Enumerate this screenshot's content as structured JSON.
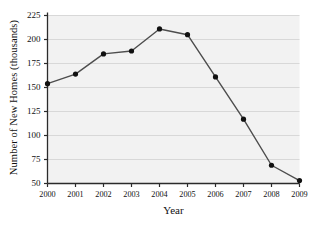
{
  "chart_data": {
    "type": "line",
    "title": "",
    "xlabel": "Year",
    "ylabel": "Number of New Homes (thousands)",
    "categories": [
      "2000",
      "2001",
      "2002",
      "2003",
      "2004",
      "2005",
      "2006",
      "2007",
      "2008",
      "2009"
    ],
    "values": [
      154,
      164,
      185,
      188,
      211,
      205,
      161,
      117,
      69,
      53
    ],
    "series": [
      {
        "name": "Number of New Homes",
        "values": [
          154,
          164,
          185,
          188,
          211,
          205,
          161,
          117,
          69,
          53
        ]
      }
    ],
    "xlim": [
      2000,
      2009
    ],
    "ylim": [
      50,
      225
    ],
    "yticks": [
      50,
      75,
      100,
      125,
      150,
      175,
      200,
      225
    ],
    "ytick_labels": [
      "50",
      "75",
      "100",
      "125",
      "150",
      "175",
      "200",
      "225"
    ],
    "xticks": [
      2000,
      2001,
      2002,
      2003,
      2004,
      2005,
      2006,
      2007,
      2008,
      2009
    ],
    "xtick_labels": [
      "2000",
      "2001",
      "2002",
      "2003",
      "2004",
      "2005",
      "2006",
      "2007",
      "2008",
      "2009"
    ],
    "grid": "horizontal",
    "legend": "none",
    "marker": "filled-circle",
    "colors": {
      "line": "#4d4d4d",
      "marker": "#111111",
      "grid": "#d8d8d8",
      "plot_background": "#f2f2f2",
      "axis": "#2b2b2b",
      "text": "#111111",
      "page_background": "#ffffff"
    }
  }
}
